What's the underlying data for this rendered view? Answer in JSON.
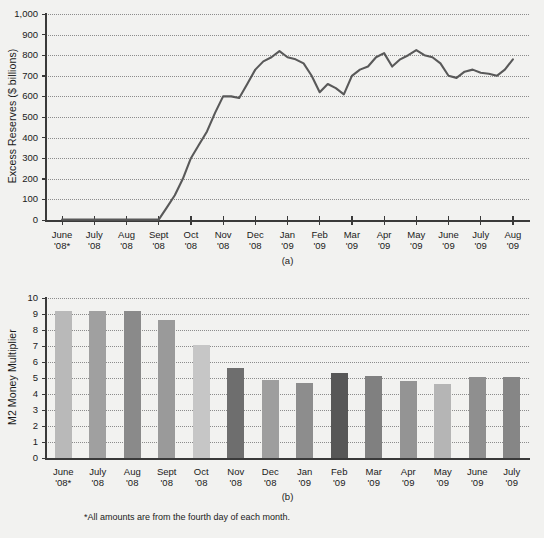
{
  "figure": {
    "background_color": "#f2f2f0",
    "footnote": "*All amounts are from the fourth day of each month.",
    "panel_a_letter": "(a)",
    "panel_b_letter": "(b)"
  },
  "chart_data": [
    {
      "id": "panel-a",
      "type": "line",
      "title": "",
      "ylabel": "Excess Reserves ($ billions)",
      "xlabel": "",
      "ylim": [
        0,
        1000
      ],
      "yticks": [
        0,
        100,
        200,
        300,
        400,
        500,
        600,
        700,
        800,
        900,
        1000
      ],
      "ytick_labels": [
        "0",
        "100",
        "200",
        "300",
        "400",
        "500",
        "600",
        "700",
        "800",
        "900",
        "1,000"
      ],
      "grid": true,
      "legend": "none",
      "line_color": "#595959",
      "categories": [
        "June '08*",
        "July '08",
        "Aug '08",
        "Sept '08",
        "Oct '08",
        "Nov '08",
        "Dec '08",
        "Jan '09",
        "Feb '09",
        "Mar '09",
        "Apr '09",
        "May '09",
        "June '09",
        "July '09",
        "Aug '09"
      ],
      "tick_labels": [
        [
          "June",
          "'08*"
        ],
        [
          "July",
          "'08"
        ],
        [
          "Aug",
          "'08"
        ],
        [
          "Sept",
          "'08"
        ],
        [
          "Oct",
          "'08"
        ],
        [
          "Nov",
          "'08"
        ],
        [
          "Dec",
          "'08"
        ],
        [
          "Jan",
          "'09"
        ],
        [
          "Feb",
          "'09"
        ],
        [
          "Mar",
          "'09"
        ],
        [
          "Apr",
          "'09"
        ],
        [
          "May",
          "'09"
        ],
        [
          "June",
          "'09"
        ],
        [
          "July",
          "'09"
        ],
        [
          "Aug",
          "'09"
        ]
      ],
      "x": [
        0.0,
        0.5,
        1.0,
        1.5,
        2.0,
        2.5,
        3.0,
        3.25,
        3.5,
        3.75,
        4.0,
        4.25,
        4.5,
        4.75,
        5.0,
        5.25,
        5.5,
        5.75,
        6.0,
        6.25,
        6.5,
        6.75,
        7.0,
        7.25,
        7.5,
        7.75,
        8.0,
        8.25,
        8.5,
        8.75,
        9.0,
        9.25,
        9.5,
        9.75,
        10.0,
        10.25,
        10.5,
        10.75,
        11.0,
        11.25,
        11.5,
        11.75,
        12.0,
        12.25,
        12.5,
        12.75,
        13.0,
        13.25,
        13.5,
        13.75,
        14.0
      ],
      "values": [
        2,
        2,
        2,
        2,
        2,
        2,
        2,
        60,
        120,
        200,
        300,
        365,
        430,
        520,
        600,
        600,
        592,
        660,
        730,
        770,
        790,
        820,
        790,
        780,
        760,
        700,
        620,
        660,
        640,
        610,
        700,
        730,
        745,
        790,
        810,
        745,
        780,
        800,
        825,
        800,
        790,
        760,
        700,
        690,
        720,
        730,
        715,
        710,
        700,
        730,
        780
      ],
      "notes": "Weekly series; values in $ billions. Flat near zero through early Sept 2008, sharp rise into Dec 2008, plateau 600-820 through 2009."
    },
    {
      "id": "panel-b",
      "type": "bar",
      "title": "",
      "ylabel": "M2 Money Multiplier",
      "xlabel": "",
      "ylim": [
        0,
        10
      ],
      "yticks": [
        0,
        1,
        2,
        3,
        4,
        5,
        6,
        7,
        8,
        9,
        10
      ],
      "ytick_labels": [
        "0",
        "1",
        "2",
        "3",
        "4",
        "5",
        "6",
        "7",
        "8",
        "9",
        "10"
      ],
      "grid": true,
      "legend": "none",
      "categories": [
        "June '08*",
        "July '08",
        "Aug '08",
        "Sept '08",
        "Oct '08",
        "Nov '08",
        "Dec '08",
        "Jan '09",
        "Feb '09",
        "Mar '09",
        "Apr '09",
        "May '09",
        "June '09",
        "July '09"
      ],
      "tick_labels": [
        [
          "June",
          "'08*"
        ],
        [
          "July",
          "'08"
        ],
        [
          "Aug",
          "'08"
        ],
        [
          "Sept",
          "'08"
        ],
        [
          "Oct",
          "'08"
        ],
        [
          "Nov",
          "'08"
        ],
        [
          "Dec",
          "'08"
        ],
        [
          "Jan",
          "'09"
        ],
        [
          "Feb",
          "'09"
        ],
        [
          "Mar",
          "'09"
        ],
        [
          "Apr",
          "'09"
        ],
        [
          "May",
          "'09"
        ],
        [
          "June",
          "'09"
        ],
        [
          "July",
          "'09"
        ]
      ],
      "values": [
        9.2,
        9.2,
        9.2,
        8.6,
        7.05,
        5.6,
        4.85,
        4.7,
        5.3,
        5.1,
        4.8,
        4.65,
        5.05,
        5.05
      ],
      "bar_colors": [
        "#b9b9b9",
        "#a0a0a0",
        "#8a8a8a",
        "#9a9a9a",
        "#c6c6c6",
        "#6e6e6e",
        "#9e9e9e",
        "#8d8d8d",
        "#575757",
        "#808080",
        "#949494",
        "#b5b5b5",
        "#8f8f8f",
        "#868686"
      ]
    }
  ]
}
